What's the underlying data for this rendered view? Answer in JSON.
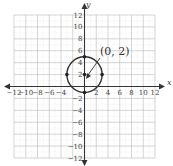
{
  "chart_data": {
    "type": "scatter",
    "title": "",
    "xlabel": "x",
    "ylabel": "y",
    "xlim": [
      -12,
      12
    ],
    "ylim": [
      -12,
      12
    ],
    "grid": true,
    "x_ticks": [
      -12,
      -10,
      -8,
      -6,
      -4,
      -2,
      2,
      4,
      6,
      8,
      10,
      12
    ],
    "y_ticks": [
      12,
      10,
      8,
      6,
      4,
      2,
      -2,
      -4,
      -6,
      -8,
      -10,
      -12
    ],
    "x_tick_labels": [
      "−12",
      "−10",
      "−8",
      "−6",
      "−4",
      "",
      "2",
      "4",
      "6",
      "8",
      "10",
      "12"
    ],
    "y_tick_labels": [
      "12",
      "10",
      "8",
      "6",
      "4",
      "2",
      "−2",
      "−4",
      "−6",
      "−8",
      "−10",
      "−12"
    ],
    "shapes": [
      {
        "type": "circle",
        "center": [
          0,
          2
        ],
        "radius": 3
      }
    ],
    "points": [
      {
        "x": 0,
        "y": 2,
        "role": "center"
      },
      {
        "x": 0,
        "y": 5
      },
      {
        "x": 0,
        "y": -1
      },
      {
        "x": 3,
        "y": 2
      },
      {
        "x": -3,
        "y": 2
      }
    ],
    "annotations": [
      {
        "text": "(0, 2)",
        "points_to": [
          0,
          2
        ]
      }
    ]
  },
  "labels": {
    "center_annotation": "(0, 2)",
    "x_axis_name": "x",
    "y_axis_name": "y"
  }
}
